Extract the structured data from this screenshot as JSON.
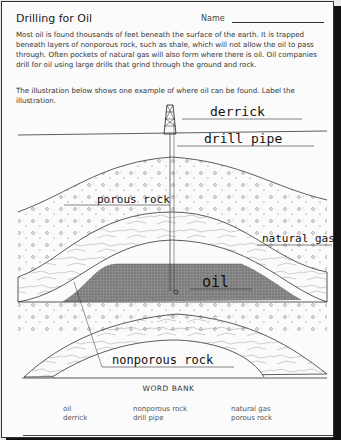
{
  "worksheet": {
    "title": "Drilling for Oil",
    "name_label": "Name",
    "paragraph1": "Most oil is found thousands of feet beneath the surface of the earth. It is trapped beneath layers of nonporous rock, such as shale, which will not allow the oil to pass through. Often pockets of natural gas will also form where there is oil. Oil companies drill for oil using large drills that grind through the ground and rock.",
    "paragraph2": "The illustration below shows one example of where oil can be found. Label the illustration."
  },
  "labels": {
    "derrick": "derrick",
    "drill_pipe": "drill pipe",
    "porous_rock": "porous rock",
    "natural_gas": "natural gas",
    "oil": "oil",
    "nonporous_rock": "nonporous rock"
  },
  "word_bank": {
    "title": "WORD BANK",
    "columns": [
      [
        "oil",
        "derrick"
      ],
      [
        "nonporous rock",
        "drill pipe"
      ],
      [
        "natural gas",
        "porous rock"
      ]
    ]
  },
  "colors": {
    "oil_fill": "#7a7a7a",
    "ink": "#222222"
  }
}
